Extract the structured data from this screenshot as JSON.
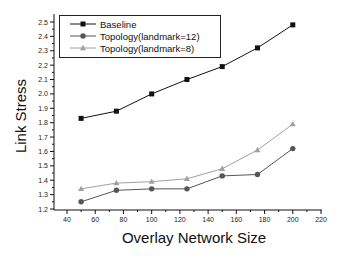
{
  "chart_data": {
    "type": "line",
    "title": "",
    "xlabel": "Overlay Network Size",
    "ylabel": "Link Stress",
    "xlim": [
      40,
      220
    ],
    "ylim": [
      1.2,
      2.5
    ],
    "xticks": [
      40,
      60,
      80,
      100,
      120,
      140,
      160,
      180,
      200,
      220
    ],
    "yticks": [
      1.2,
      1.3,
      1.4,
      1.5,
      1.6,
      1.7,
      1.8,
      1.9,
      2.0,
      2.1,
      2.2,
      2.3,
      2.4,
      2.5
    ],
    "grid": false,
    "legend_position": "upper-left",
    "x": [
      50,
      75,
      100,
      125,
      150,
      175,
      200
    ],
    "series": [
      {
        "name": "Baseline",
        "marker": "square",
        "color": "#111111",
        "values": [
          1.83,
          1.88,
          2.0,
          2.1,
          2.19,
          2.32,
          2.48
        ]
      },
      {
        "name": "Topology(landmark=12)",
        "marker": "circle",
        "color": "#555555",
        "values": [
          1.25,
          1.33,
          1.34,
          1.34,
          1.43,
          1.44,
          1.62
        ]
      },
      {
        "name": "Topology(landmark=8)",
        "marker": "triangle",
        "color": "#a0a0a0",
        "values": [
          1.34,
          1.38,
          1.39,
          1.41,
          1.48,
          1.61,
          1.79
        ]
      }
    ]
  }
}
